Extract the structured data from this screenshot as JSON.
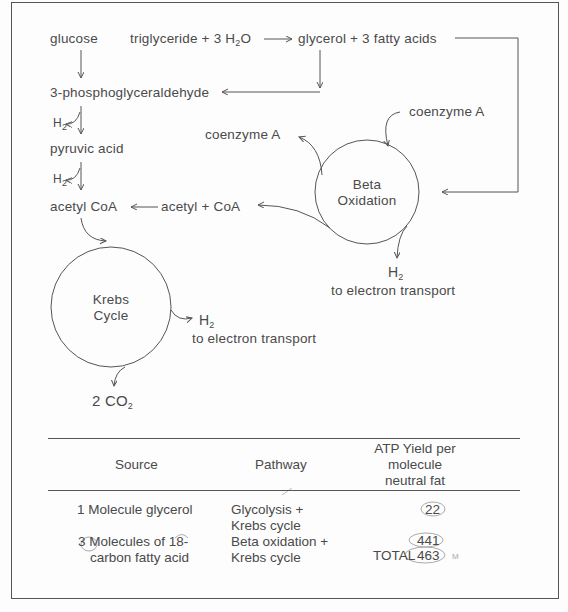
{
  "diagram": {
    "nodes": {
      "glucose": "glucose",
      "triglyceride": "triglyceride + 3 H",
      "triglyceride_sub": "2",
      "triglyceride_tail": "O",
      "glycerol_fatty": "glycerol + 3 fatty acids",
      "pgal": "3-phosphoglyceraldehyde",
      "h2_a": "H",
      "h2_a_sub": "2",
      "pyruvic": "pyruvic acid",
      "h2_b": "H",
      "h2_b_sub": "2",
      "acetyl_coa": "acetyl CoA",
      "acetyl_plus_coa": "acetyl + CoA",
      "coenzyme_a_left": "coenzyme A",
      "coenzyme_a_right": "coenzyme A",
      "beta_line1": "Beta",
      "beta_line2": "Oxidation",
      "krebs_line1": "Krebs",
      "krebs_line2": "Cycle",
      "h2_beta": "H",
      "h2_beta_sub": "2",
      "beta_et": "to electron transport",
      "h2_krebs": "H",
      "h2_krebs_sub": "2",
      "krebs_et": "to electron transport",
      "co2": "2 CO",
      "co2_sub": "2"
    }
  },
  "table": {
    "headers": {
      "source": "Source",
      "pathway": "Pathway",
      "yield_l1": "ATP Yield per",
      "yield_l2": "molecule",
      "yield_l3": "neutral fat"
    },
    "rows": [
      {
        "source_l1": "1 Molecule glycerol",
        "source_l2": "",
        "pathway_l1": "Glycolysis +",
        "pathway_l2": "Krebs cycle",
        "yield": "22"
      },
      {
        "source_l1": "3 Molecules of 18-",
        "source_l2": "carbon fatty acid",
        "pathway_l1": "Beta oxidation +",
        "pathway_l2": "Krebs cycle",
        "yield": "441"
      }
    ],
    "total_label": "TOTAL",
    "total_value": "463",
    "annotation_mark": "M"
  }
}
